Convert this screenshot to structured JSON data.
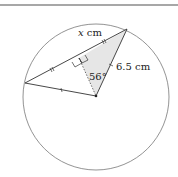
{
  "diagram": {
    "labels": {
      "chord": "x cm",
      "chord_var": "x",
      "chord_unit": " cm",
      "radius": "6.5 cm",
      "angle": "56°"
    },
    "colors": {
      "stroke": "#333333",
      "circle": "#777777",
      "shade": "#e6e6e6",
      "topline": "#888888"
    }
  }
}
